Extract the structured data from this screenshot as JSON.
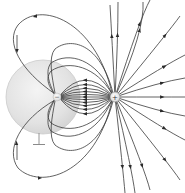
{
  "diagram": {
    "type": "electric-field-lines",
    "colors": {
      "background": "#ffffff",
      "field_line": "#3a3a3a",
      "sphere_fill": "#e4e4e4",
      "sphere_edge": "#c8c8c8",
      "charge_fill": "#f2f2f2"
    },
    "sphere": {
      "cx": 43,
      "cy": 97,
      "r": 37
    },
    "negative_charge": {
      "symbol": "−",
      "cx": 57,
      "cy": 97,
      "r": 4
    },
    "positive_charge": {
      "symbol": "+",
      "cx": 115,
      "cy": 97,
      "r": 5
    },
    "ground": {
      "x": 39,
      "top": 132,
      "bottom": 145,
      "bar_half_width": 6,
      "icon": "ground-icon"
    }
  }
}
